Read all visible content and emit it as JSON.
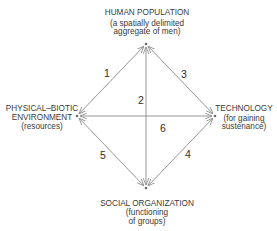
{
  "diagram": {
    "type": "bidirectional-relationship-diamond",
    "nodes": {
      "top": {
        "title": "HUMAN POPULATION",
        "lines": [
          "HUMAN POPULATION",
          "(a spatially delimited",
          "aggregate of men)"
        ]
      },
      "left": {
        "title": "PHYSICAL–BIOTIC ENVIRONMENT",
        "lines": [
          "PHYSICAL–BIOTIC",
          "ENVIRONMENT",
          "(resources)"
        ]
      },
      "right": {
        "title": "TECHNOLOGY",
        "lines": [
          "TECHNOLOGY",
          "(for gaining",
          "sustenance)"
        ]
      },
      "bottom": {
        "title": "SOCIAL ORGANIZATION",
        "lines": [
          "SOCIAL ORGANIZATION",
          "(functioning",
          "of groups)"
        ]
      }
    },
    "edges": [
      {
        "label": "1",
        "from": "left",
        "to": "top",
        "direction": "both"
      },
      {
        "label": "2",
        "from": "bottom",
        "to": "top",
        "direction": "both"
      },
      {
        "label": "3",
        "from": "right",
        "to": "top",
        "direction": "both"
      },
      {
        "label": "4",
        "from": "right",
        "to": "bottom",
        "direction": "both"
      },
      {
        "label": "5",
        "from": "left",
        "to": "bottom",
        "direction": "both"
      },
      {
        "label": "6",
        "from": "left",
        "to": "right",
        "direction": "both"
      }
    ],
    "colors": {
      "line": "#8a8a8a",
      "text": "#3a3a3a",
      "background": "#ffffff"
    }
  }
}
